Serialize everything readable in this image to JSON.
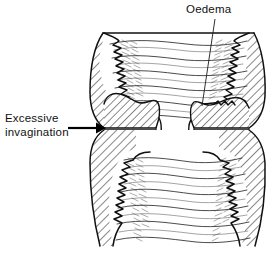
{
  "figure": {
    "background_color": "#ffffff",
    "line_color": "#111111",
    "hatch_color": "#222222",
    "width": 280,
    "height": 257
  },
  "labels": {
    "oedema": {
      "text": "Oedema",
      "x": 186,
      "y": 13
    },
    "invagination_line1": {
      "text": "Excessive",
      "x": 5,
      "y": 122
    },
    "invagination_line2": {
      "text": "invagination",
      "x": 5,
      "y": 136
    }
  },
  "annotations": {
    "oedema_leader": {
      "name": "oedema-leader-line",
      "from_x": 215,
      "from_y": 18,
      "to_x": 202,
      "to_y": 106
    },
    "invagination_arrow": {
      "name": "invagination-arrow",
      "from_x": 68,
      "from_y": 128,
      "to_x": 104,
      "to_y": 128
    }
  },
  "structures": [
    {
      "name": "upper-chamber-lumen",
      "description": "Upper intestinal lumen with transverse mucosal folds"
    },
    {
      "name": "lower-chamber-lumen",
      "description": "Lower intestinal lumen with transverse mucosal folds"
    },
    {
      "name": "wall-upper-left",
      "description": "Hatched intestinal wall, upper left"
    },
    {
      "name": "wall-upper-right",
      "description": "Hatched intestinal wall, upper right"
    },
    {
      "name": "wall-lower-left",
      "description": "Hatched intestinal wall, lower left"
    },
    {
      "name": "wall-lower-right",
      "description": "Hatched intestinal wall, lower right"
    },
    {
      "name": "lobe-upper-left",
      "description": "Invaginated hatched lobe, upper left (intussusceptum)"
    },
    {
      "name": "lobe-upper-right",
      "description": "Oedematous hatched lobe, upper right"
    },
    {
      "name": "lobe-lower-left",
      "description": "Invaginated hatched lobe, lower left"
    },
    {
      "name": "lobe-lower-right",
      "description": "Invaginated hatched lobe, lower right"
    }
  ]
}
